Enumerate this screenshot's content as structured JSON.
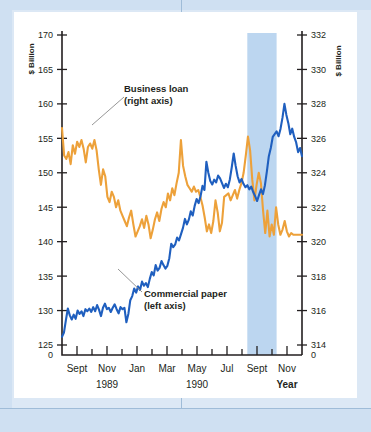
{
  "figure": {
    "background_color": "#cfe0f2",
    "plate_color": "#ffffff"
  },
  "chart_data": {
    "type": "line",
    "title": "",
    "xlabel": "Year",
    "grid": false,
    "legend_position": "inline-annotations",
    "axes": {
      "left": {
        "label": "$ Billion",
        "ticks": [
          0,
          125,
          130,
          135,
          140,
          145,
          150,
          155,
          160,
          165,
          170
        ],
        "tick_labels": [
          "0",
          "125",
          "130",
          "135",
          "140",
          "145",
          "150",
          "155",
          "160",
          "165",
          "170"
        ],
        "range_display": [
          125,
          170
        ],
        "zero_break": true
      },
      "right": {
        "label": "$ Billion",
        "ticks": [
          0,
          314,
          316,
          318,
          320,
          322,
          324,
          326,
          328,
          330,
          332
        ],
        "tick_labels": [
          "0",
          "314",
          "316",
          "318",
          "320",
          "322",
          "324",
          "326",
          "328",
          "330",
          "332"
        ],
        "range_display": [
          314,
          332
        ],
        "zero_break": true
      },
      "x": {
        "tick_labels": [
          "Sept",
          "Nov",
          "Jan",
          "Mar",
          "May",
          "Jul",
          "Sept",
          "Nov"
        ],
        "minor_ticks_between": 1,
        "year_groups": [
          {
            "label": "1989",
            "center_month": "Nov"
          },
          {
            "label": "1990",
            "center_month": "May"
          }
        ],
        "axis_caption": "Year",
        "months": [
          "Sept 1989",
          "Oct 1989",
          "Nov 1989",
          "Dec 1989",
          "Jan 1990",
          "Feb 1990",
          "Mar 1990",
          "Apr 1990",
          "May 1990",
          "Jun 1990",
          "Jul 1990",
          "Aug 1990",
          "Sept 1990",
          "Oct 1990",
          "Nov 1990",
          "Dec 1990"
        ]
      }
    },
    "shaded_band": {
      "color": "#bcd6f0",
      "start_label": "Aug 1990",
      "end_label": "Oct 1990",
      "start_frac": 0.772,
      "end_frac": 0.894
    },
    "series": [
      {
        "name": "Business loan",
        "axis": "right",
        "color": "#eda13a",
        "annotation": {
          "line1": "Business loan",
          "line2": "(right axis)"
        },
        "values": [
          326.6,
          325.0,
          324.8,
          325.2,
          324.5,
          325.6,
          325.1,
          325.8,
          325.5,
          325.9,
          325.4,
          324.6,
          325.5,
          325.7,
          325.4,
          325.9,
          325.3,
          324.2,
          323.3,
          324.2,
          323.8,
          322.6,
          322.3,
          322.9,
          322.6,
          322.0,
          322.4,
          321.8,
          321.5,
          321.2,
          320.9,
          321.4,
          321.8,
          321.0,
          320.3,
          320.6,
          320.9,
          321.3,
          320.8,
          321.5,
          321.0,
          320.2,
          320.7,
          321.3,
          321.7,
          321.2,
          321.9,
          322.3,
          322.0,
          322.8,
          322.4,
          323.1,
          322.7,
          323.4,
          324.0,
          325.9,
          324.4,
          323.8,
          323.3,
          323.1,
          322.9,
          323.2,
          322.9,
          323.0,
          322.6,
          322.1,
          321.4,
          320.6,
          321.0,
          320.5,
          321.2,
          322.4,
          321.7,
          320.6,
          321.1,
          322.6,
          322.7,
          322.8,
          322.4,
          322.7,
          323.0,
          322.5,
          323.0,
          323.4,
          324.0,
          325.0,
          326.1,
          325.3,
          323.6,
          322.4,
          323.3,
          324.0,
          323.4,
          321.8,
          320.5,
          321.8,
          320.3,
          321.0,
          320.4,
          322.0,
          321.0,
          320.4,
          320.7,
          321.2,
          320.6,
          320.3,
          320.5,
          320.4,
          320.4,
          320.4,
          320.4,
          320.4
        ]
      },
      {
        "name": "Commercial paper",
        "axis": "left",
        "color": "#1f5fbf",
        "annotation": {
          "line1": "Commercial paper",
          "line2": "(left axis)"
        },
        "values": [
          126.2,
          126.8,
          128.6,
          130.3,
          129.3,
          128.7,
          129.4,
          128.8,
          130.0,
          129.5,
          129.9,
          129.2,
          130.2,
          129.9,
          130.3,
          129.8,
          130.5,
          129.9,
          130.8,
          130.1,
          129.2,
          130.4,
          131.0,
          130.2,
          130.4,
          129.8,
          130.4,
          130.9,
          130.2,
          129.6,
          130.5,
          130.2,
          130.4,
          128.3,
          129.5,
          131.5,
          132.1,
          133.2,
          132.6,
          133.5,
          133.0,
          134.2,
          133.6,
          134.0,
          133.4,
          134.6,
          135.6,
          135.1,
          136.6,
          135.8,
          136.2,
          137.2,
          136.6,
          136.1,
          136.5,
          137.6,
          139.7,
          139.2,
          139.6,
          140.6,
          140.2,
          141.1,
          142.0,
          143.3,
          142.5,
          143.2,
          144.4,
          143.8,
          145.2,
          146.2,
          145.6,
          146.6,
          148.1,
          147.5,
          151.6,
          150.0,
          148.8,
          148.3,
          149.0,
          148.6,
          149.6,
          149.2,
          148.5,
          147.8,
          148.4,
          147.9,
          149.0,
          150.8,
          152.8,
          151.0,
          149.5,
          148.6,
          149.1,
          148.4,
          147.9,
          148.2,
          147.6,
          148.0,
          147.2,
          146.6,
          145.9,
          146.8,
          147.6,
          146.9,
          148.2,
          150.2,
          152.4,
          153.6,
          155.2,
          155.6,
          156.0,
          155.3,
          156.4,
          158.0,
          160.0,
          158.4,
          157.2,
          155.6,
          156.4,
          155.2,
          154.4,
          153.0,
          153.6,
          152.4
        ]
      }
    ]
  }
}
